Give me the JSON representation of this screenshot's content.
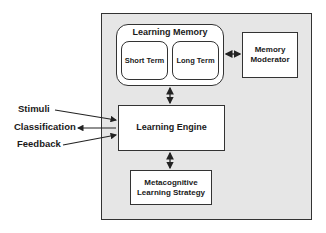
{
  "diagram": {
    "nodes": {
      "learning_memory": "Learning Memory",
      "short_term": "Short Term",
      "long_term": "Long Term",
      "memory_moderator_line1": "Memory",
      "memory_moderator_line2": "Moderator",
      "learning_engine": "Learning Engine",
      "metacognitive_line1": "Metacognitive",
      "metacognitive_line2": "Learning Strategy"
    },
    "external_labels": {
      "stimuli": "Stimuli",
      "classification": "Classification",
      "feedback": "Feedback"
    },
    "edges": [
      {
        "from": "Learning Memory",
        "to": "Memory Moderator",
        "type": "bidirectional"
      },
      {
        "from": "Learning Memory",
        "to": "Learning Engine",
        "type": "bidirectional"
      },
      {
        "from": "Learning Engine",
        "to": "Metacognitive Learning Strategy",
        "type": "bidirectional"
      },
      {
        "from": "Stimuli",
        "to": "Learning Engine",
        "type": "directed"
      },
      {
        "from": "Learning Engine",
        "to": "Classification",
        "type": "directed"
      },
      {
        "from": "Feedback",
        "to": "Learning Engine",
        "type": "directed"
      }
    ],
    "colors": {
      "system_background": "#e6e6e6",
      "box_fill": "#ffffff",
      "stroke": "#333333"
    }
  }
}
